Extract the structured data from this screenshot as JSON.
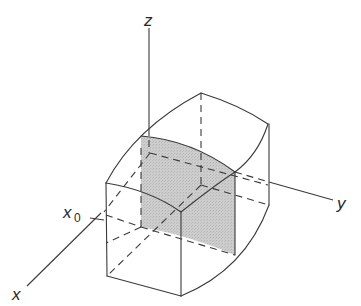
{
  "figure": {
    "axes": {
      "z_label": "z",
      "y_label": "y",
      "x_label": "x",
      "x0_label": "x",
      "x0_subscript": "0"
    },
    "colors": {
      "line": "#3a3a3a",
      "shade": "#c8c8c8",
      "background": "#ffffff"
    }
  }
}
